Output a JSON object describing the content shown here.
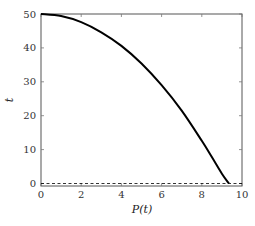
{
  "chart_data": {
    "type": "line",
    "title": "",
    "xlabel": "P(t)",
    "ylabel": "t",
    "xlim": [
      0,
      10
    ],
    "ylim": [
      0,
      50
    ],
    "grid": false,
    "legend": null,
    "x_ticks": [
      0,
      2,
      4,
      6,
      8,
      10
    ],
    "y_ticks": [
      0,
      10,
      20,
      30,
      40,
      50
    ],
    "series": [
      {
        "name": "curve",
        "style": "solid",
        "color": "#000000",
        "x": [
          0,
          1,
          2,
          3,
          4,
          5,
          6,
          7,
          8,
          8.5,
          9,
          9.35
        ],
        "y": [
          50,
          49.4,
          47.6,
          44.6,
          40.6,
          35.4,
          29.0,
          21.5,
          12.6,
          7.8,
          2.9,
          0
        ]
      },
      {
        "name": "reference",
        "style": "dashed",
        "color": "#000000",
        "x": [
          0,
          10
        ],
        "y": [
          0,
          0
        ]
      }
    ]
  }
}
